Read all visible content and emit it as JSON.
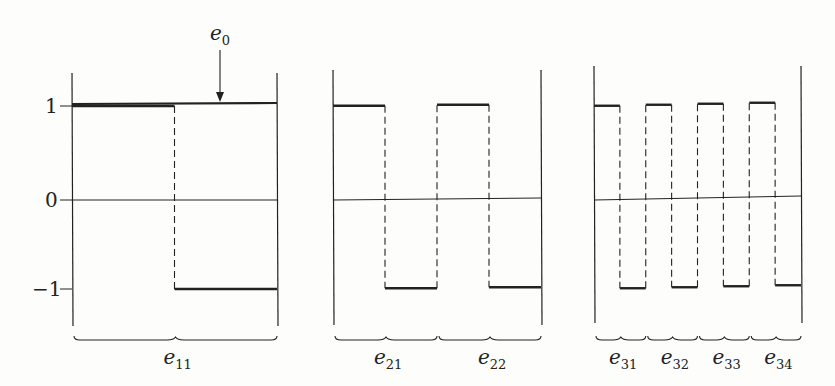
{
  "y_ticks": [
    {
      "label": "1",
      "value": 1
    },
    {
      "label": "0",
      "value": 0
    },
    {
      "label": "−1",
      "value": -1
    }
  ],
  "annotation": {
    "label": "e",
    "sub": "0",
    "target": "constant function e0 = 1 over whole interval"
  },
  "panels": [
    {
      "name": "level-1",
      "braces": [
        {
          "label": "e",
          "sub": "11"
        }
      ],
      "signal": [
        1,
        -1
      ]
    },
    {
      "name": "level-2",
      "braces": [
        {
          "label": "e",
          "sub": "21"
        },
        {
          "label": "e",
          "sub": "22"
        }
      ],
      "signal": [
        1,
        -1,
        1,
        -1
      ]
    },
    {
      "name": "level-3",
      "braces": [
        {
          "label": "e",
          "sub": "31"
        },
        {
          "label": "e",
          "sub": "32"
        },
        {
          "label": "e",
          "sub": "33"
        },
        {
          "label": "e",
          "sub": "34"
        }
      ],
      "signal": [
        1,
        -1,
        1,
        -1,
        1,
        -1,
        1,
        -1
      ]
    }
  ],
  "colors": {
    "ink": "#222222",
    "background": "#fdfdfc"
  }
}
